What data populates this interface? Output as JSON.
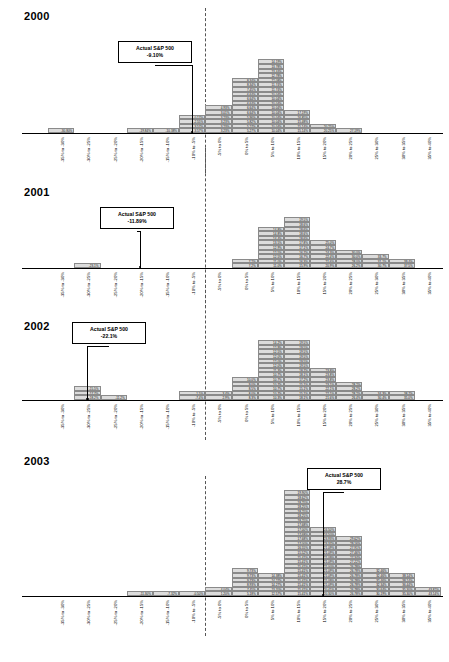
{
  "chart_data": {
    "type": "bar",
    "xlabel": "",
    "ylabel": "",
    "grid": false,
    "legend": "none",
    "categories": [
      "-35% to -30%",
      "-30% to -25%",
      "-25% to -20%",
      "-20% to -15%",
      "-15% to -10%",
      "-10% to -5%",
      "-5% to 0%",
      "0% to 5%",
      "5% to 10%",
      "10% to 15%",
      "15% to 20%",
      "20% to 25%",
      "25% to 30%",
      "30% to 35%",
      "35% to 40%",
      "40% to 45%"
    ],
    "panels": [
      {
        "year": "2000",
        "actual_label": "Actual S&P 500",
        "actual_value": "-9.10%",
        "actual_bin_index": 6,
        "bins": [
          [],
          [
            "-30.80%"
          ],
          [],
          [],
          [
            "-19.84%"
          ],
          [
            "-10.38%"
          ],
          [
            "-3.57%",
            "-3.57%",
            "-2.55%",
            "-0.17%"
          ],
          [
            "3.23%",
            "3.23%",
            "3.23%",
            "3.23%",
            "3.01%",
            "4.93%"
          ],
          [
            "5.27%",
            "5.27%",
            "5.82%",
            "5.96%",
            "6.64%",
            "6.64%",
            "6.64%",
            "6.64%",
            "6.64%",
            "7.45%",
            "8.34%",
            "8.34%"
          ],
          [
            "10.04%",
            "10.04%",
            "10.04%",
            "10.04%",
            "10.04%",
            "10.04%",
            "10.04%",
            "10.04%",
            "10.04%",
            "11.74%",
            "11.74%",
            "12.08%",
            "12.78%",
            "13.44%",
            "13.78%",
            "14.19%"
          ],
          [
            "15.14%",
            "15.14%",
            "15.48%",
            "16.85%",
            "17.19%"
          ],
          [
            "20.25%",
            "20.25%"
          ],
          [
            "27.19%"
          ],
          [],
          [],
          []
        ]
      },
      {
        "year": "2001",
        "actual_label": "Actual S&P 500",
        "actual_value": "-11.89%",
        "actual_bin_index": 4,
        "bins": [
          [],
          [],
          [
            "-23.1%"
          ],
          [],
          [],
          [],
          [],
          [],
          [
            "7.2%",
            "7.2%"
          ],
          [
            "11.0%",
            "11.0%",
            "12.5%",
            "12.5%",
            "12.9%",
            "13.5%",
            "14.4%",
            "14.8%",
            "14.8%"
          ],
          [
            "15.9%",
            "16.3%",
            "16.7%",
            "16.7%",
            "17.1%",
            "17.8%",
            "18.6%",
            "18.6%",
            "18.6%",
            "18.6%",
            "19.5%"
          ],
          [
            "20.9%",
            "21.6%",
            "22.4%",
            "24.3%",
            "24.7%",
            "25.0%"
          ],
          [
            "26.2%",
            "28.0%",
            "30.0%",
            "30.0%"
          ],
          [
            "30.7%",
            "31.1%",
            "33.7%"
          ],
          [
            "37.5%",
            "39.4%"
          ],
          []
        ]
      },
      {
        "year": "2002",
        "actual_label": "Actual S&P 500",
        "actual_value": "-22.1%",
        "actual_bin_index": 2,
        "bins": [
          [],
          [],
          [
            "-18.2%",
            "-17.7%",
            "-15.5%"
          ],
          [
            "-11.2%"
          ],
          [],
          [],
          [
            "-7.4%",
            "-1.5%"
          ],
          [
            "2.9%",
            "3.4%"
          ],
          [
            "8.3%",
            "8.0%",
            "8.5%",
            "9.0%",
            "10.0%"
          ],
          [
            "10.3%",
            "10.7%",
            "10.7%",
            "10.7%",
            "10.7%",
            "10.7%",
            "11.3%",
            "12.0%",
            "12.0%",
            "12.0%",
            "12.5%",
            "12.9%",
            "14.2%"
          ],
          [
            "18.1%",
            "15.1%",
            "15.1%",
            "15.1%",
            "17.2%",
            "18.1%",
            "18.7%",
            "19.5%",
            "19.5%",
            "19.5%",
            "19.5%",
            "19.5%",
            "19.5%"
          ],
          [
            "21.6%",
            "22.1%",
            "22.1%",
            "23.1%",
            "23.8%",
            "23.8%",
            "23.8%"
          ],
          [
            "26.4%",
            "28.2%",
            "28.2%",
            "28.2%"
          ],
          [
            "30.4%",
            "34.3%"
          ],
          [
            "35.0%",
            "38.7%"
          ],
          []
        ]
      },
      {
        "year": "2003",
        "actual_label": "Actual S&P 500",
        "actual_value": "28.7%",
        "actual_bin_index": 11,
        "bins": [
          [],
          [],
          [],
          [],
          [
            "-11.30%"
          ],
          [
            "-7.32%"
          ],
          [
            "-0.50%"
          ],
          [
            "1.20%",
            "4.04%"
          ],
          [
            "5.18%",
            "7.45%",
            "8.93%",
            "9.73%",
            "9.73%",
            "9.73%"
          ],
          [
            "12.57%",
            "13.70%",
            "14.27%",
            "14.27%",
            "14.38%"
          ],
          [
            "15.41%",
            "15.41%",
            "15.41%",
            "15.41%",
            "15.41%",
            "15.41%",
            "15.41%",
            "15.41%",
            "15.41%",
            "15.52%",
            "16.55%",
            "17.00%",
            "17.68%",
            "17.68%",
            "17.00%",
            "17.68%",
            "18.25%",
            "18.25%",
            "18.25%",
            "18.25%",
            "18.25%",
            "18.62%",
            "19.90%"
          ],
          [
            "20.30%",
            "20.41%",
            "21.09%",
            "21.09%",
            "21.09%",
            "21.09%",
            "21.00%",
            "21.09%",
            "21.09%",
            "21.09%",
            "21.09%",
            "23.37%",
            "23.93%",
            "24.50%",
            "24.50%"
          ],
          [
            "26.78%",
            "26.78%",
            "26.78%",
            "26.78%",
            "26.78%",
            "26.78%",
            "26.78%",
            "27.22%",
            "27.34%",
            "27.46%",
            "27.91%",
            "29.16%",
            "29.62%"
          ],
          [
            "30.19%",
            "30.64%",
            "32.34%",
            "32.46%",
            "32.46%",
            "32.46%"
          ],
          [
            "35.30%",
            "35.30%",
            "36.44%",
            "38.14%",
            "38.14%"
          ],
          [
            "43.14%",
            "43.82%"
          ]
        ]
      }
    ]
  }
}
